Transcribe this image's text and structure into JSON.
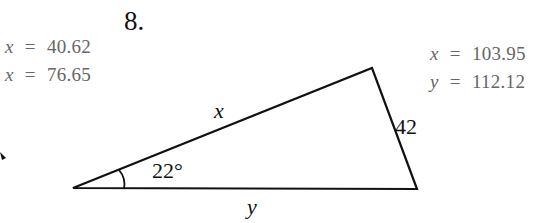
{
  "problem_number": "8.",
  "answers_left": [
    {
      "var": "x",
      "eq": "=",
      "value": "40.62"
    },
    {
      "var": "x",
      "eq": "=",
      "value": "76.65"
    }
  ],
  "answers_right": [
    {
      "var": "x",
      "eq": "=",
      "value": "103.95"
    },
    {
      "var": "y",
      "eq": "=",
      "value": "112.12"
    }
  ],
  "triangle": {
    "side_hypotenuse_label": "x",
    "side_right_label": "42",
    "side_bottom_label": "y",
    "angle_label": "22°"
  }
}
